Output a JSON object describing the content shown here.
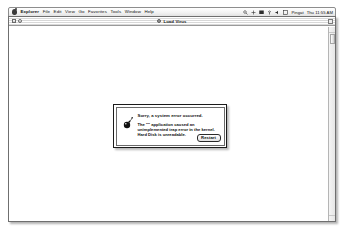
{
  "menubar": {
    "apple_icon": "apple-logo-icon",
    "items": [
      {
        "label": "Explorer",
        "bold": true
      },
      {
        "label": "File",
        "bold": false
      },
      {
        "label": "Edit",
        "bold": false
      },
      {
        "label": "View",
        "bold": false
      },
      {
        "label": "Go",
        "bold": false
      },
      {
        "label": "Favorites",
        "bold": false
      },
      {
        "label": "Tools",
        "bold": false
      },
      {
        "label": "Window",
        "bold": false
      },
      {
        "label": "Help",
        "bold": false
      }
    ],
    "status_icons": [
      {
        "name": "search-icon"
      },
      {
        "name": "plus-icon"
      },
      {
        "name": "display-icon"
      },
      {
        "name": "airport-icon"
      },
      {
        "name": "speaker-icon"
      },
      {
        "name": "applescript-icon"
      }
    ],
    "user_label": "Pingat",
    "clock": "Thu 11:55 AM"
  },
  "window": {
    "title": "Load Virus",
    "title_icon": "document-icon",
    "close_button": "close-box",
    "collapse_button": "collapse-box",
    "grow_button": "grow-box",
    "scrollbar": {
      "up_arrow": "scroll-up-arrow",
      "down_arrow": "scroll-down-arrow",
      "thumb": "scroll-thumb"
    }
  },
  "dialog": {
    "icon": "bomb-icon",
    "heading": "Sorry, a system error occurred.",
    "body_lines": [
      "The \"\" application caused an",
      "unimplemented trap error in the kernel.",
      "Hard Disk is unreadable.",
      ""
    ],
    "restart_label": "Restart"
  }
}
